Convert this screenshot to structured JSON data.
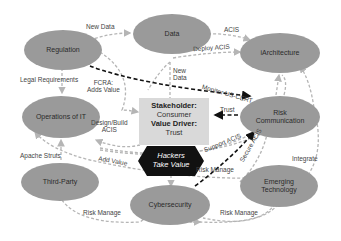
{
  "nodes": {
    "regulation": "Regulation",
    "data": "Data",
    "iarchitecture": "iArchitecture",
    "operations_it": "Operations of IT",
    "risk_communication": "Risk Communication",
    "third_party": "Third-Party",
    "cybersecurity": "Cybersecurity",
    "emerging_technology": "Emerging Technology"
  },
  "center": {
    "stakeholder_label": "Stakeholder:",
    "stakeholder_value": "Consumer",
    "value_driver_label": "Value Driver:",
    "value_driver_value": "Trust"
  },
  "hackers": {
    "line1": "Hackers",
    "line2": "Take Value"
  },
  "edges": {
    "new_data_top": "New Data",
    "acis_top": "ACIS",
    "deploy_acis": "Deploy ACIS",
    "legal_requirements": "Legal Requirements",
    "fcra_line1": "FCRA:",
    "fcra_line2": "Adds Value",
    "new_data_line1": "New",
    "new_data_line2": "Data",
    "monitor_us_cert": "Monitor US-CERT",
    "trust": "Trust",
    "design_build_line1": "Design/Build",
    "design_build_line2": "ACIS",
    "apache_struts": "Apache Struts",
    "add_value": "Add Value",
    "support_acis": "Support ACIS",
    "secure_acis": "Secure ACIS",
    "risk_manage_center": "Risk Manage",
    "integrate": "Integrate",
    "risk_manage_left": "Risk Manage",
    "risk_manage_right": "Risk Manage"
  },
  "colors": {
    "node_fill": "#9a9a9a",
    "center_fill": "#d9d9d9",
    "hexagon_fill": "#111111",
    "dashed_gray": "#b5b5b5",
    "dashed_black": "#111111"
  }
}
